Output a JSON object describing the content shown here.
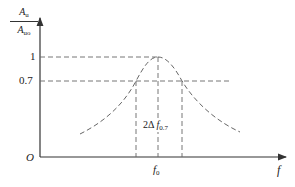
{
  "diagram": {
    "type": "resonance-curve",
    "y_label": {
      "num_base": "A",
      "num_sub": "u",
      "den_base": "A",
      "den_sub": "uo"
    },
    "x_label": "f",
    "origin_label": "O",
    "y_ticks": [
      {
        "label": "1",
        "value": 1
      },
      {
        "label": "0.7",
        "value": 0.7
      }
    ],
    "center_freq": {
      "base": "f",
      "sub": "0"
    },
    "bandwidth_label": {
      "prefix": "2Δ ",
      "base": "f",
      "sub": "0.7"
    },
    "colors": {
      "axis": "#333333",
      "curve": "#555555",
      "dash": "#666666"
    }
  }
}
